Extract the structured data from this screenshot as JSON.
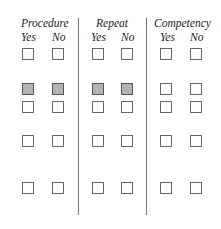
{
  "groups": [
    {
      "title": "Procedure",
      "yes_label": "Yes",
      "no_label": "No"
    },
    {
      "title": "Repeat",
      "yes_label": "Yes",
      "no_label": "No"
    },
    {
      "title": "Competency",
      "yes_label": "Yes",
      "no_label": "No"
    }
  ],
  "rows": [
    {
      "filled": [
        false,
        false,
        false,
        false,
        false,
        false
      ]
    },
    {
      "filled": [
        true,
        true,
        true,
        true,
        false,
        false
      ]
    },
    {
      "filled": [
        false,
        false,
        false,
        false,
        false,
        false
      ]
    },
    {
      "filled": [
        false,
        false,
        false,
        false,
        false,
        false
      ]
    },
    {
      "filled": [
        false,
        false,
        false,
        false,
        false,
        false
      ]
    }
  ],
  "colors": {
    "filled_checkbox": "#b4b4b4",
    "border": "#666666",
    "divider": "#777777"
  }
}
